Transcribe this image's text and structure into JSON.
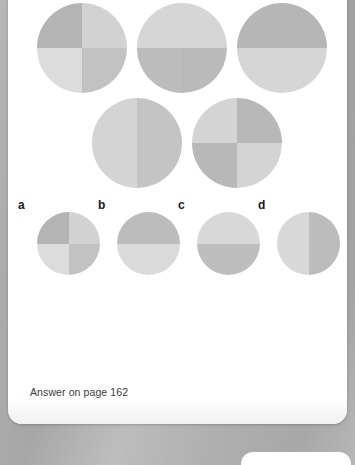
{
  "puzzle": {
    "type": "visual-analogy-quadrant-shading",
    "answer_note": "Answer on page 162",
    "palette": {
      "dark": "#b4b4b4",
      "medium": "#c2c2c2",
      "light": "#d2d2d2",
      "lightest": "#dcdcdc",
      "page_background": "#ffffff",
      "outer_background": "#a9a9a9",
      "label_color": "#1a1a1a"
    },
    "figures": [
      {
        "id": "fig-1",
        "row": 1,
        "position": 1,
        "quadrants": {
          "top_left": "#b4b4b4",
          "top_right": "#d2d2d2",
          "bottom_left": "#dcdcdc",
          "bottom_right": "#c2c2c2"
        }
      },
      {
        "id": "fig-2",
        "row": 1,
        "position": 2,
        "quadrants": {
          "top_left": "#d6d6d6",
          "top_right": "#d6d6d6",
          "bottom_left": "#bcbcbc",
          "bottom_right": "#bababa"
        }
      },
      {
        "id": "fig-3",
        "row": 1,
        "position": 3,
        "quadrants": {
          "top_left": "#b6b6b6",
          "top_right": "#b6b6b6",
          "bottom_left": "#d6d6d6",
          "bottom_right": "#d6d6d6"
        }
      },
      {
        "id": "fig-4",
        "row": 2,
        "position": 1,
        "quadrants": {
          "top_left": "#d4d4d4",
          "top_right": "#c4c4c4",
          "bottom_left": "#d4d4d4",
          "bottom_right": "#c4c4c4"
        }
      },
      {
        "id": "fig-5",
        "row": 2,
        "position": 2,
        "quadrants": {
          "top_left": "#d4d4d4",
          "top_right": "#b8b8b8",
          "bottom_left": "#b8b8b8",
          "bottom_right": "#d4d4d4"
        }
      }
    ],
    "options": [
      {
        "label": "a",
        "id": "opt-a",
        "quadrants": {
          "top_left": "#b4b4b4",
          "top_right": "#d2d2d2",
          "bottom_left": "#dcdcdc",
          "bottom_right": "#c2c2c2"
        }
      },
      {
        "label": "b",
        "id": "opt-b",
        "quadrants": {
          "top_left": "#bcbcbc",
          "top_right": "#bcbcbc",
          "bottom_left": "#dadada",
          "bottom_right": "#dadada"
        }
      },
      {
        "label": "c",
        "id": "opt-c",
        "quadrants": {
          "top_left": "#d8d8d8",
          "top_right": "#d8d8d8",
          "bottom_left": "#bebebe",
          "bottom_right": "#bebebe"
        }
      },
      {
        "label": "d",
        "id": "opt-d",
        "quadrants": {
          "top_left": "#d8d8d8",
          "top_right": "#bcbcbc",
          "bottom_left": "#d8d8d8",
          "bottom_right": "#bcbcbc"
        }
      }
    ]
  }
}
